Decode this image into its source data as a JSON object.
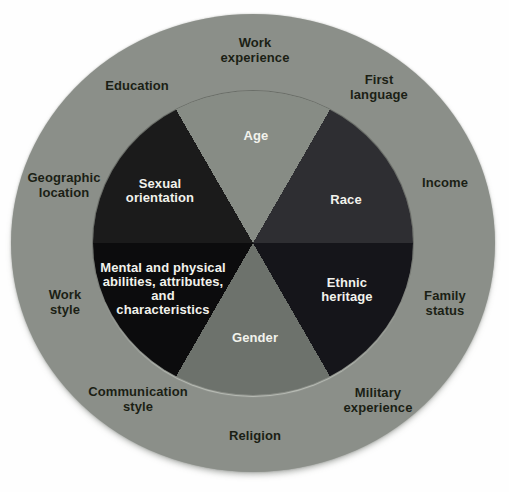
{
  "wheel": {
    "description": "Diversity wheel diagram: inner pie of primary dimensions, outer ring of secondary dimensions",
    "colors": {
      "background": "#fefefe",
      "outer_ring": "#8b8f89",
      "outer_label_text": "#1b1f15",
      "inner_label_text": "#f2f2ec"
    },
    "outer_labels": {
      "work_experience": "Work\nexperience",
      "first_language": "First\nlanguage",
      "income": "Income",
      "family_status": "Family\nstatus",
      "military_experience": "Military\nexperience",
      "religion": "Religion",
      "communication_style": "Communication\nstyle",
      "work_style": "Work\nstyle",
      "geographic_location": "Geographic\nlocation",
      "education": "Education"
    },
    "segment_order": [
      "age",
      "race",
      "ethnic_heritage",
      "gender",
      "mental_physical",
      "sexual_orientation"
    ],
    "segment_arc_degrees": 60,
    "segments": {
      "age": {
        "label": "Age",
        "color": "#878c85"
      },
      "race": {
        "label": "Race",
        "color": "#2e2e32"
      },
      "ethnic_heritage": {
        "label": "Ethnic\nheritage",
        "color": "#15151a"
      },
      "gender": {
        "label": "Gender",
        "color": "#6d726c"
      },
      "mental_physical": {
        "label": "Mental and physical\nabilities, attributes,\nand\ncharacteristics",
        "color": "#0c0c0d"
      },
      "sexual_orientation": {
        "label": "Sexual\norientation",
        "color": "#1b1b1b"
      }
    }
  }
}
